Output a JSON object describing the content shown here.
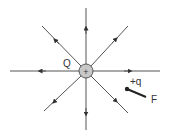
{
  "diagram": {
    "source_charge": {
      "label": "Q",
      "sign": "+",
      "fill": "#c8c8c8",
      "stroke": "#555555"
    },
    "test_charge": {
      "label": "+q",
      "force_label": "F"
    },
    "line_color": "#555555",
    "field_direction": "outward",
    "field_lines": [
      {
        "direction": "up"
      },
      {
        "direction": "up-right"
      },
      {
        "direction": "right"
      },
      {
        "direction": "down-right"
      },
      {
        "direction": "down"
      },
      {
        "direction": "down-left"
      },
      {
        "direction": "left"
      },
      {
        "direction": "up-left"
      }
    ]
  }
}
